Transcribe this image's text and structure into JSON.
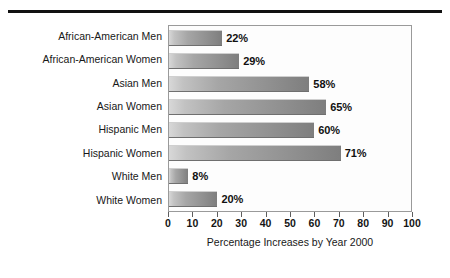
{
  "figure": {
    "rule_color": "#111111",
    "plot_border_color": "#9a9a9a",
    "plot_background": "#fdfdfd",
    "bar_color_light": "#d8d8d8",
    "bar_color_dark": "#7e7e7e"
  },
  "chart_data": {
    "type": "bar",
    "orientation": "horizontal",
    "title": "",
    "xlabel": "Percentage Increases by Year 2000",
    "ylabel": "",
    "xlim": [
      0,
      100
    ],
    "xticks": [
      "0",
      "10",
      "20",
      "30",
      "40",
      "50",
      "60",
      "70",
      "80",
      "90",
      "100"
    ],
    "xtick_values": [
      0,
      10,
      20,
      30,
      40,
      50,
      60,
      70,
      80,
      90,
      100
    ],
    "grid": false,
    "legend": false,
    "categories": [
      "African-American Men",
      "African-American Women",
      "Asian Men",
      "Asian Women",
      "Hispanic Men",
      "Hispanic Women",
      "White Men",
      "White Women"
    ],
    "values": [
      22,
      29,
      58,
      65,
      60,
      71,
      8,
      20
    ],
    "data_labels": [
      "22%",
      "29%",
      "58%",
      "65%",
      "60%",
      "71%",
      "8%",
      "20%"
    ]
  }
}
